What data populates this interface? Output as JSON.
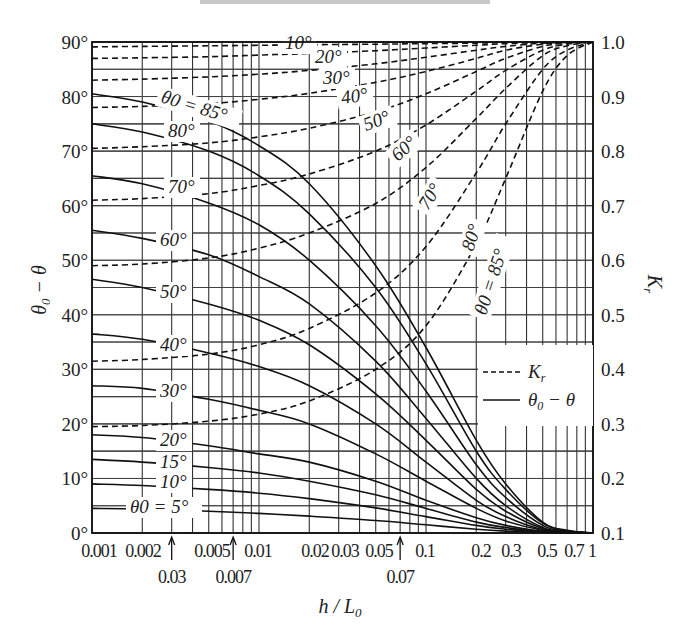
{
  "chart_data": {
    "type": "line",
    "title": "",
    "xlabel": "h / L0",
    "ylabel_left": "θ0 − θ",
    "ylabel_right": "Kr",
    "xscale": "log",
    "xlim": [
      0.001,
      1
    ],
    "ylim_left": [
      0,
      90
    ],
    "ylim_right": [
      0.1,
      1.0
    ],
    "grid": true,
    "x_ticks": [
      {
        "value": 0.001,
        "label": "0.001"
      },
      {
        "value": 0.002,
        "label": "0.002"
      },
      {
        "value": 0.005,
        "label": "0.005"
      },
      {
        "value": 0.01,
        "label": "0.01"
      },
      {
        "value": 0.02,
        "label": "0.02"
      },
      {
        "value": 0.03,
        "label": "0.03"
      },
      {
        "value": 0.05,
        "label": "0.05"
      },
      {
        "value": 0.1,
        "label": "0.1"
      },
      {
        "value": 0.2,
        "label": "0.2"
      },
      {
        "value": 0.3,
        "label": "0.3"
      },
      {
        "value": 0.5,
        "label": "0.5"
      },
      {
        "value": 0.7,
        "label": "0.7"
      },
      {
        "value": 1,
        "label": "1"
      }
    ],
    "x_arrow_annotations": [
      {
        "value": 0.003,
        "label": "0.03"
      },
      {
        "value": 0.007,
        "label": "0.007"
      },
      {
        "value": 0.07,
        "label": "0.07"
      }
    ],
    "y_left_ticks": [
      "0°",
      "10°",
      "20°",
      "30°",
      "40°",
      "50°",
      "60°",
      "70°",
      "80°",
      "90°"
    ],
    "y_right_ticks": [
      "0.1",
      "0.2",
      "0.3",
      "0.4",
      "0.5",
      "0.6",
      "0.7",
      "0.8",
      "0.9",
      "1.0"
    ],
    "legend": {
      "position": "right-middle",
      "entries": [
        {
          "style": "dashed",
          "label": "Kr"
        },
        {
          "style": "solid",
          "label": "θ0 − θ"
        }
      ]
    },
    "x": [
      0.001,
      0.002,
      0.005,
      0.01,
      0.02,
      0.05,
      0.1,
      0.2,
      0.3,
      0.5,
      0.7,
      1.0
    ],
    "series_refraction_angle": [
      {
        "name": "θ0 = 85°",
        "axis": "left",
        "values": [
          80.5,
          79,
          75.5,
          71,
          64,
          49,
          34,
          17,
          9,
          2,
          0.5,
          0
        ]
      },
      {
        "name": "80°",
        "axis": "left",
        "values": [
          75,
          73.5,
          70,
          65.5,
          58.5,
          45,
          31,
          15,
          8,
          1.8,
          0.4,
          0
        ]
      },
      {
        "name": "70°",
        "axis": "left",
        "values": [
          65.5,
          64,
          60.5,
          56.5,
          50,
          38,
          26,
          12.5,
          6.5,
          1.4,
          0.3,
          0
        ]
      },
      {
        "name": "60°",
        "axis": "left",
        "values": [
          55.5,
          54,
          51,
          47,
          42,
          31.5,
          21,
          10,
          5,
          1,
          0.2,
          0
        ]
      },
      {
        "name": "50°",
        "axis": "left",
        "values": [
          46.5,
          45,
          42,
          39,
          34.5,
          25.5,
          17,
          8,
          4,
          0.8,
          0.2,
          0
        ]
      },
      {
        "name": "40°",
        "axis": "left",
        "values": [
          36.5,
          35.5,
          33,
          30.5,
          27,
          20,
          13,
          6,
          3,
          0.6,
          0.1,
          0
        ]
      },
      {
        "name": "30°",
        "axis": "left",
        "values": [
          27,
          26.5,
          24.5,
          22.5,
          20,
          14.5,
          9.5,
          4.5,
          2.2,
          0.5,
          0.1,
          0
        ]
      },
      {
        "name": "20°",
        "axis": "left",
        "values": [
          18,
          17.5,
          16,
          14.5,
          13,
          9.5,
          6,
          2.8,
          1.4,
          0.3,
          0.1,
          0
        ]
      },
      {
        "name": "15°",
        "axis": "left",
        "values": [
          13.5,
          13,
          12,
          11,
          9.5,
          7,
          4.5,
          2,
          1,
          0.2,
          0,
          0
        ]
      },
      {
        "name": "10°",
        "axis": "left",
        "values": [
          9,
          8.7,
          8,
          7.3,
          6.3,
          4.6,
          3,
          1.4,
          0.7,
          0.15,
          0,
          0
        ]
      },
      {
        "name": "θ0 = 5°",
        "axis": "left",
        "values": [
          4.5,
          4.4,
          4,
          3.6,
          3.1,
          2.3,
          1.5,
          0.7,
          0.35,
          0.1,
          0,
          0
        ]
      }
    ],
    "series_refraction_coefficient": [
      {
        "name": "10°",
        "axis": "right",
        "values": [
          0.991,
          0.992,
          0.993,
          0.994,
          0.995,
          0.996,
          0.997,
          0.998,
          0.999,
          1.0,
          1.0,
          1.0
        ]
      },
      {
        "name": "20°",
        "axis": "right",
        "values": [
          0.97,
          0.971,
          0.973,
          0.976,
          0.979,
          0.984,
          0.989,
          0.994,
          0.997,
          0.999,
          1.0,
          1.0
        ]
      },
      {
        "name": "30°",
        "axis": "right",
        "values": [
          0.93,
          0.932,
          0.936,
          0.941,
          0.948,
          0.96,
          0.972,
          0.985,
          0.992,
          0.998,
          0.999,
          1.0
        ]
      },
      {
        "name": "40°",
        "axis": "right",
        "values": [
          0.88,
          0.882,
          0.887,
          0.895,
          0.906,
          0.926,
          0.946,
          0.97,
          0.985,
          0.996,
          0.999,
          1.0
        ]
      },
      {
        "name": "50°",
        "axis": "right",
        "values": [
          0.805,
          0.808,
          0.815,
          0.826,
          0.842,
          0.872,
          0.905,
          0.946,
          0.97,
          0.992,
          0.998,
          1.0
        ]
      },
      {
        "name": "60°",
        "axis": "right",
        "values": [
          0.71,
          0.713,
          0.722,
          0.737,
          0.758,
          0.8,
          0.848,
          0.91,
          0.948,
          0.985,
          0.996,
          1.0
        ]
      },
      {
        "name": "70°",
        "axis": "right",
        "values": [
          0.59,
          0.593,
          0.604,
          0.622,
          0.65,
          0.704,
          0.77,
          0.86,
          0.915,
          0.975,
          0.993,
          1.0
        ]
      },
      {
        "name": "80°",
        "axis": "right",
        "values": [
          0.415,
          0.418,
          0.428,
          0.445,
          0.475,
          0.54,
          0.625,
          0.76,
          0.85,
          0.95,
          0.985,
          1.0
        ]
      },
      {
        "name": "θ0 = 85°",
        "axis": "right",
        "values": [
          0.295,
          0.297,
          0.305,
          0.318,
          0.342,
          0.4,
          0.48,
          0.63,
          0.75,
          0.91,
          0.975,
          1.0
        ]
      }
    ]
  },
  "labels": {
    "solid": [
      "θ0 = 85°",
      "80°",
      "70°",
      "60°",
      "50°",
      "40°",
      "30°",
      "20°",
      "15°",
      "10°",
      "θ0 = 5°"
    ],
    "dashed": [
      "10°",
      "20°",
      "30°",
      "40°",
      "50°",
      "60°",
      "70°",
      "80°",
      "θ0 = 85°"
    ],
    "legend_dashed": "Kr",
    "legend_solid": "θ0 − θ"
  }
}
